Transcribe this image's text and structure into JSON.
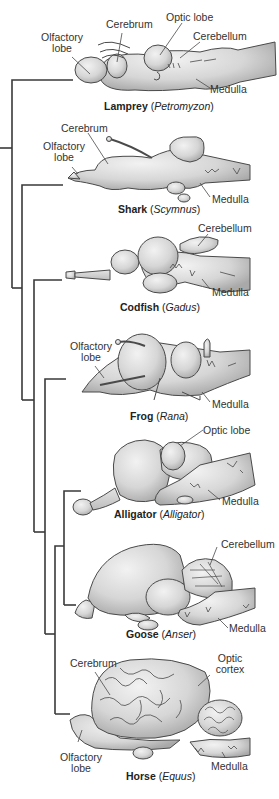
{
  "colors": {
    "line": "#3a3a3a",
    "brain_fill": "#d9d9d9",
    "brain_shade": "#b8b8b8",
    "brain_stroke": "#4a4a4a",
    "background": "#ffffff"
  },
  "species": [
    {
      "common": "Lamprey",
      "genus": "Petromyzon",
      "labels": [
        "Olfactory\nlobe",
        "Cerebrum",
        "Optic lobe",
        "Cerebellum",
        "Medulla"
      ]
    },
    {
      "common": "Shark",
      "genus": "Scymnus",
      "labels": [
        "Cerebrum",
        "Olfactory\nlobe",
        "Medulla"
      ]
    },
    {
      "common": "Codfish",
      "genus": "Gadus",
      "labels": [
        "Cerebellum",
        "Medulla"
      ]
    },
    {
      "common": "Frog",
      "genus": "Rana",
      "labels": [
        "Olfactory\nlobe",
        "Medulla"
      ]
    },
    {
      "common": "Alligator",
      "genus": "Alligator",
      "labels": [
        "Optic lobe",
        "Medulla"
      ]
    },
    {
      "common": "Goose",
      "genus": "Anser",
      "labels": [
        "Cerebellum",
        "Medulla"
      ]
    },
    {
      "common": "Horse",
      "genus": "Equus",
      "labels": [
        "Cerebrum",
        "Optic\ncortex",
        "Olfactory\nlobe",
        "Medulla"
      ]
    }
  ]
}
